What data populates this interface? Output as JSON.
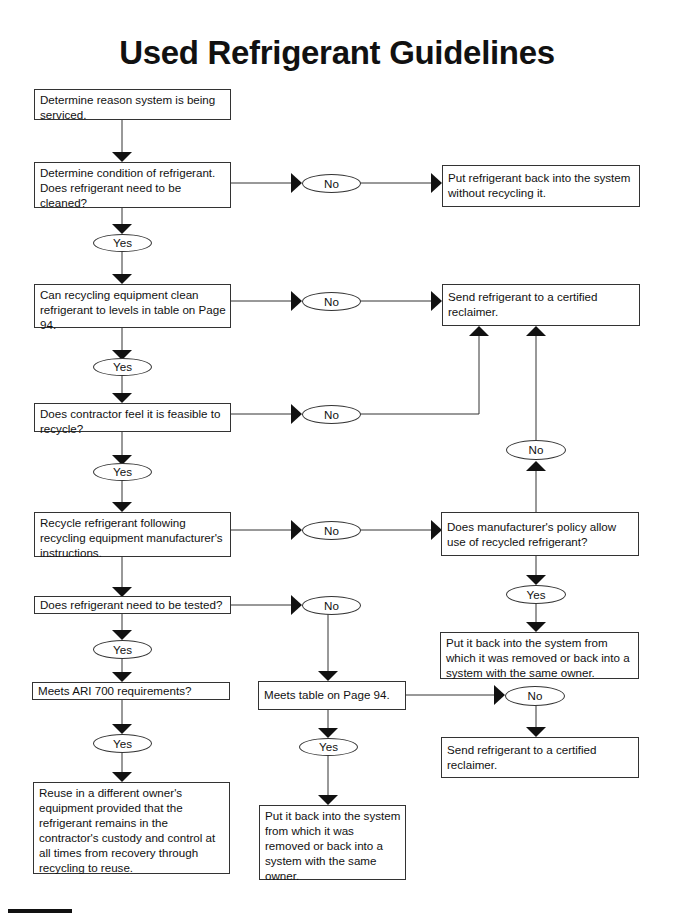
{
  "title": "Used Refrigerant Guidelines",
  "nodes": {
    "reason": "Determine reason system is being serviced.",
    "condition": "Determine condition of refrigerant. Does refrigerant need to be cleaned?",
    "put_back_no_recycle": "Put refrigerant back into the system without recycling it.",
    "can_clean": "Can recycling equipment clean refrigerant to levels in table on Page 94.",
    "reclaimer_top": "Send refrigerant to a certified reclaimer.",
    "feasible": "Does contractor feel it is feasible to recycle?",
    "recycle": "Recycle refrigerant following recycling equipment manufacturer's instructions.",
    "manufacturer_policy": "Does manufacturer's policy allow use of recycled refrigerant?",
    "put_back_same_owner_right": "Put it back into the system from which it was removed or back into a system with the same owner.",
    "tested": "Does refrigerant need to be tested?",
    "ari700": "Meets ARI 700 requirements?",
    "meets_table": "Meets table on Page 94.",
    "reclaimer_bottom": "Send refrigerant to a certified reclaimer.",
    "reuse_different_owner": "Reuse in a different owner's equipment provided that the refrigerant remains in the contractor's custody and control at all times from recovery through recycling to reuse.",
    "put_back_same_owner_mid": "Put it back into the system from which it was removed or back into a system with the same owner."
  },
  "labels": {
    "yes": "Yes",
    "no": "No"
  }
}
